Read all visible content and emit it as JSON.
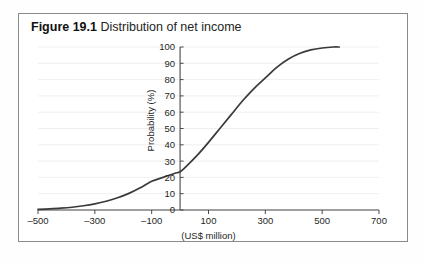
{
  "figure": {
    "caption_number": "Figure 19.1",
    "caption_text": " Distribution of net income",
    "border_color": "#8a8a8a",
    "background_color": "#ffffff"
  },
  "chart_data": {
    "type": "line",
    "title": "Distribution of net income",
    "xlabel": "(US$ million)",
    "ylabel": "Probability (%)",
    "xlim": [
      -500,
      700
    ],
    "ylim": [
      0,
      100
    ],
    "grid": true,
    "legend": "none",
    "curve_color": "#3a3a3a",
    "x_ticks": [
      -500,
      -300,
      -100,
      100,
      300,
      500,
      700
    ],
    "x_tick_labels": [
      "–500",
      "–300",
      "–100",
      "100",
      "300",
      "500",
      "700"
    ],
    "y_ticks": [
      0,
      10,
      20,
      30,
      40,
      50,
      60,
      70,
      80,
      90,
      100
    ],
    "y_tick_labels": [
      "0",
      "10",
      "20",
      "30",
      "40",
      "50",
      "60",
      "70",
      "80",
      "90",
      "100"
    ],
    "series": [
      {
        "name": "Cumulative probability of net income",
        "x": [
          -500,
          -460,
          -420,
          -380,
          -340,
          -300,
          -260,
          -220,
          -180,
          -140,
          -100,
          -60,
          -20,
          0,
          20,
          60,
          100,
          140,
          180,
          220,
          260,
          300,
          340,
          380,
          420,
          460,
          500,
          540,
          560
        ],
        "y": [
          0.4,
          0.7,
          1.1,
          1.7,
          2.6,
          3.8,
          5.4,
          7.5,
          10.2,
          13.6,
          17.6,
          20.0,
          22.4,
          23.5,
          26.5,
          33.5,
          41.5,
          50.0,
          58.5,
          67.0,
          74.5,
          81.0,
          87.5,
          92.5,
          96.0,
          98.2,
          99.4,
          100.0,
          100.0
        ]
      }
    ]
  }
}
